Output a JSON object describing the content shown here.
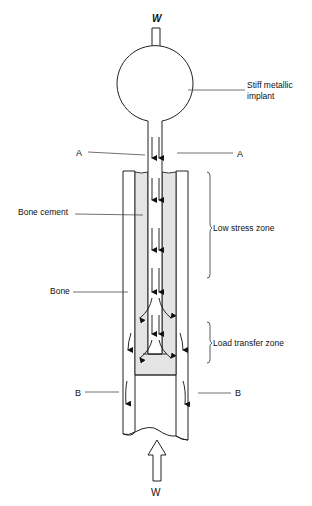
{
  "diagram": {
    "load_symbol_top": "W",
    "load_symbol_bottom": "W",
    "labels": {
      "implant": [
        "Stiff metallic",
        "implant"
      ],
      "section_a_left": "A",
      "section_a_right": "A",
      "bone_cement": "Bone cement",
      "low_stress_zone": "Low stress zone",
      "bone": "Bone",
      "load_transfer_zone": "Load transfer zone",
      "section_b_left": "B",
      "section_b_right": "B"
    },
    "colors": {
      "line": "#222222",
      "cement_fill": "#e4e4e4",
      "background": "#ffffff"
    }
  }
}
